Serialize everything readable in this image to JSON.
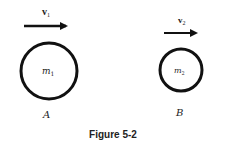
{
  "figure": {
    "caption": "Figure 5-2",
    "objects": [
      {
        "id": "A",
        "label": "A",
        "mass_label": "m",
        "mass_sub": "1",
        "velocity_label": "v",
        "velocity_sub": "1"
      },
      {
        "id": "B",
        "label": "B",
        "mass_label": "m",
        "mass_sub": "2",
        "velocity_label": "v",
        "velocity_sub": "2"
      }
    ],
    "colors": {
      "stroke": "#111111",
      "background": "#ffffff"
    }
  }
}
